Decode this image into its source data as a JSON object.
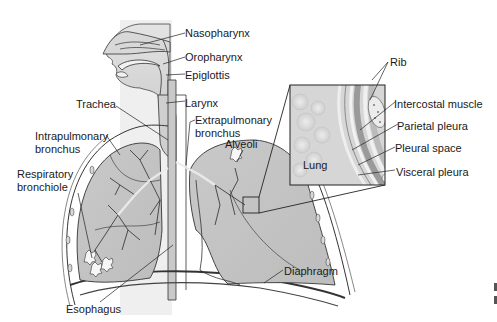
{
  "diagram": {
    "labels": {
      "nasopharynx": "Nasopharynx",
      "oropharynx": "Oropharynx",
      "epiglottis": "Epiglottis",
      "trachea": "Trachea",
      "larynx": "Larynx",
      "extrapulmonary_1": "Extrapulmonary",
      "extrapulmonary_2": "bronchus",
      "intrapulmonary_1": "Intrapulmonary",
      "intrapulmonary_2": "bronchus",
      "alveoli": "Alveoli",
      "respiratory_1": "Respiratory",
      "respiratory_2": "bronchiole",
      "esophagus": "Esophagus",
      "diaphragm": "Diaphragm"
    },
    "inset": {
      "lung": "Lung",
      "rib": "Rib",
      "intercostal": "Intercostal muscle",
      "parietal": "Parietal pleura",
      "pleural_space": "Pleural space",
      "visceral": "Visceral pleura"
    },
    "colors": {
      "background": "#ffffff",
      "tissue_gray": "#b9b9b9",
      "lung_gray": "#c4c4c4",
      "airway_light": "#e8e8e8",
      "line": "#2a2a2a"
    }
  }
}
